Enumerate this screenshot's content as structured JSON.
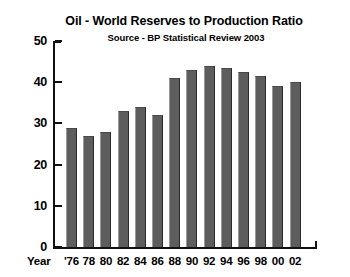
{
  "chart_data": {
    "type": "bar",
    "title": "Oil - World Reserves to Production Ratio",
    "subtitle": "Source - BP Statistical Review 2003",
    "xlabel": "Year",
    "ylabel": "",
    "ylim": [
      0,
      50
    ],
    "ytick_values": [
      50,
      40,
      30,
      20,
      10,
      0
    ],
    "ytick_labels": [
      "50",
      "40",
      "30",
      "20",
      "10",
      "0"
    ],
    "grid": false,
    "legend": "none",
    "categories": [
      "'76",
      "78",
      "80",
      "82",
      "84",
      "86",
      "88",
      "90",
      "92",
      "94",
      "96",
      "98",
      "00",
      "02"
    ],
    "values": [
      29,
      27,
      28,
      33,
      34,
      32,
      41,
      43,
      44,
      43.5,
      42.5,
      41.5,
      39,
      40
    ],
    "bar_color": "#5d5d5d",
    "axis_color": "#111111"
  },
  "axis": {
    "x_name": "Year"
  }
}
